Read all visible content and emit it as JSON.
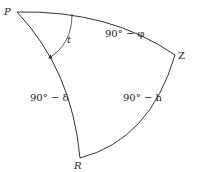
{
  "diagram": {
    "vertices": {
      "P": "P",
      "Z": "Z",
      "R": "R"
    },
    "sides": {
      "PZ": "90° − φ",
      "PR": "90° − δ",
      "ZR": "90° − h"
    },
    "angle": {
      "at_P": "t"
    },
    "stroke_color": "#333333"
  }
}
